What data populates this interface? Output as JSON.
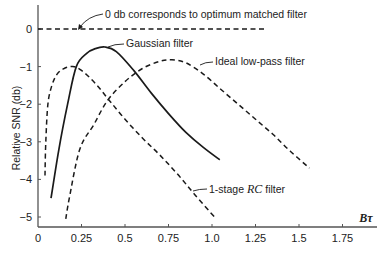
{
  "chart_data": {
    "type": "line",
    "title": "",
    "xlabel": "Bτ",
    "ylabel": "Relative SNR (db)",
    "xlim": [
      0,
      1.9
    ],
    "ylim": [
      -5.2,
      0.4
    ],
    "grid": false,
    "legend": "none (curves labeled with annotations)",
    "x_ticks": [
      0,
      0.25,
      0.5,
      0.75,
      1.0,
      1.25,
      1.5,
      1.75
    ],
    "x_tick_labels": [
      "0",
      "0.25",
      "0.5",
      "0.75",
      "1.0",
      "1.25",
      "1.5",
      "1.75"
    ],
    "y_ticks": [
      0,
      -1,
      -2,
      -3,
      -4,
      -5
    ],
    "y_tick_labels": [
      "0",
      "-1",
      "-2",
      "-3",
      "-4",
      "-5"
    ],
    "series": [
      {
        "name": "0 db reference (optimum matched filter)",
        "style": "dashed",
        "x": [
          0,
          1.3
        ],
        "y": [
          0,
          0
        ]
      },
      {
        "name": "Gaussian filter",
        "style": "solid",
        "x": [
          0.075,
          0.12,
          0.17,
          0.22,
          0.28,
          0.33,
          0.385,
          0.45,
          0.55,
          0.65,
          0.75,
          0.85,
          0.95,
          1.045
        ],
        "y": [
          -4.5,
          -3.2,
          -2.0,
          -1.0,
          -0.65,
          -0.52,
          -0.48,
          -0.6,
          -1.1,
          -1.7,
          -2.25,
          -2.75,
          -3.15,
          -3.48
        ]
      },
      {
        "name": "1-stage RC filter",
        "style": "dashed",
        "x": [
          0.04,
          0.045,
          0.057,
          0.08,
          0.11,
          0.15,
          0.2,
          0.25,
          0.33,
          0.41,
          0.5,
          0.6,
          0.7,
          0.8,
          0.9,
          1.02
        ],
        "y": [
          -3.9,
          -3.0,
          -2.0,
          -1.5,
          -1.2,
          -1.05,
          -1.0,
          -1.1,
          -1.45,
          -1.9,
          -2.4,
          -2.9,
          -3.35,
          -3.85,
          -4.4,
          -5.03
        ]
      },
      {
        "name": "Ideal low-pass filter",
        "style": "dashed",
        "x": [
          0.16,
          0.18,
          0.24,
          0.32,
          0.4,
          0.5,
          0.6,
          0.7,
          0.77,
          0.85,
          0.95,
          1.05,
          1.15,
          1.25,
          1.35,
          1.45,
          1.56
        ],
        "y": [
          -5.05,
          -4.5,
          -3.2,
          -2.55,
          -1.9,
          -1.4,
          -1.05,
          -0.86,
          -0.82,
          -0.9,
          -1.2,
          -1.6,
          -2.0,
          -2.4,
          -2.8,
          -3.25,
          -3.7
        ]
      }
    ],
    "annotations": [
      {
        "text": "0 db corresponds to optimum matched filter",
        "target": "0 db reference line"
      },
      {
        "text": "Gaussian filter",
        "target": "Gaussian curve peak"
      },
      {
        "text": "Ideal low-pass filter",
        "target": "Ideal low-pass curve"
      },
      {
        "text": "1-stage RC filter",
        "target": "RC curve"
      }
    ]
  },
  "labels": {
    "annot_zero": "0 db corresponds to optimum matched filter",
    "annot_gauss": "Gaussian filter",
    "annot_ideal": "Ideal low-pass filter",
    "annot_rc_prefix": "1-stage ",
    "annot_rc_italic": "RC",
    "annot_rc_suffix": " filter",
    "xlabel": "Bτ",
    "ylabel": "Relative SNR (db)"
  },
  "colors": {
    "ink": "#1a1a1a",
    "axis": "#555555",
    "background": "#ffffff"
  }
}
